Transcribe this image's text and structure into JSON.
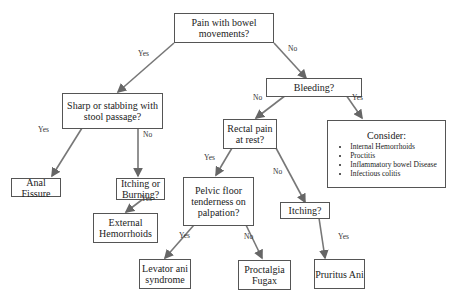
{
  "nodes": {
    "pain": "Pain with bowel movements?",
    "sharp": "Sharp or stabbing with stool passage?",
    "bleeding": "Bleeding?",
    "anal_fissure": "Anal Fissure",
    "itching_burning": "Itching or Burning?",
    "rectal_pain": "Rectal pain at rest?",
    "external": "External Hemorrhoids",
    "pelvic": "Pelvic floor tenderness on palpation?",
    "itching": "Itching?",
    "levator": "Levator ani syndrome",
    "proctalgia": "Proctalgia Fugax",
    "pruritus": "Pruritus Ani",
    "consider": {
      "title": "Consider:",
      "items": [
        "Internal Hemorrhoids",
        "Proctitis",
        "Inflammatory bowel Disease",
        "Infectious colitis"
      ]
    }
  },
  "labels": {
    "yes": "Yes",
    "no": "No"
  }
}
